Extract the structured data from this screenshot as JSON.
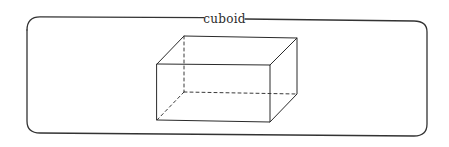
{
  "diagram": {
    "frame": {
      "label": "cuboid",
      "stroke_color": "#333333"
    },
    "shape": {
      "name": "cuboid",
      "solid_edges_color": "#2a2a2a",
      "hidden_edges_style": "dashed"
    }
  }
}
